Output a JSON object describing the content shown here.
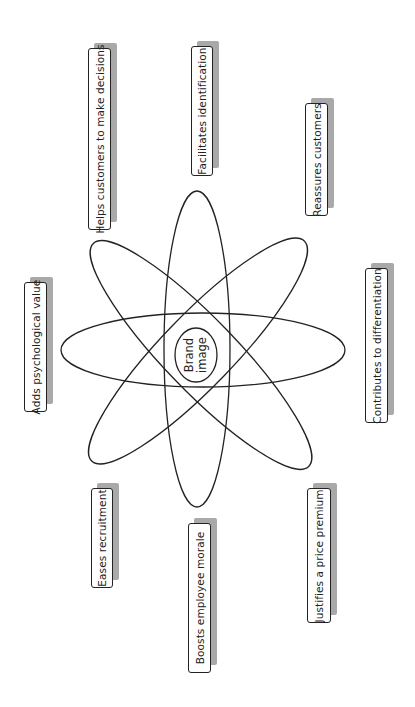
{
  "diagram": {
    "center": {
      "line1": "Brand",
      "line2": "image"
    },
    "labels": [
      {
        "id": "helps-customers",
        "text": "Helps customers to make decisions",
        "x": 88,
        "y": 48,
        "w": 23,
        "h": 182
      },
      {
        "id": "facilitates-identification",
        "text": "Facilitates identification",
        "x": 191,
        "y": 46,
        "w": 22,
        "h": 130
      },
      {
        "id": "reassures-customers",
        "text": "Reassures customers",
        "x": 305,
        "y": 103,
        "w": 23,
        "h": 113
      },
      {
        "id": "adds-psychological-value",
        "text": "Adds psychological value",
        "x": 24,
        "y": 282,
        "w": 23,
        "h": 130
      },
      {
        "id": "contributes-differentiation",
        "text": "Contributes to differentiation",
        "x": 365,
        "y": 268,
        "w": 23,
        "h": 155
      },
      {
        "id": "eases-recruitment",
        "text": "Eases recruitment",
        "x": 91,
        "y": 488,
        "w": 22,
        "h": 100
      },
      {
        "id": "boosts-morale",
        "text": "Boosts employee morale",
        "x": 188,
        "y": 523,
        "w": 23,
        "h": 150
      },
      {
        "id": "justifies-premium",
        "text": "Justifies a price premium",
        "x": 307,
        "y": 488,
        "w": 24,
        "h": 135
      }
    ],
    "colors": {
      "stroke": "#222222",
      "shadow": "#a9a9a9",
      "background": "#ffffff"
    }
  }
}
